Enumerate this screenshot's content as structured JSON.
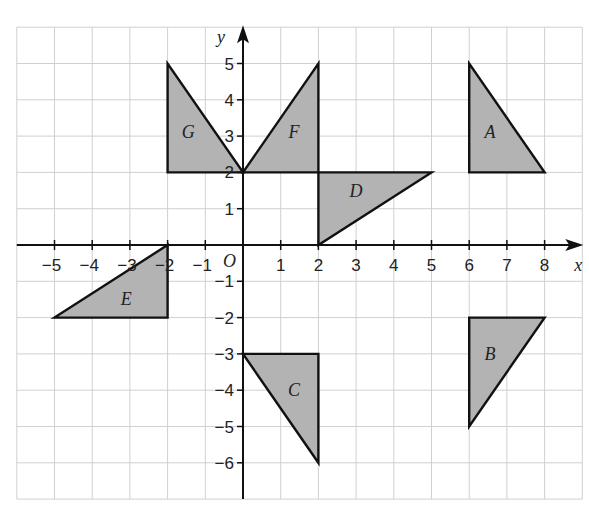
{
  "axes": {
    "x_label": "x",
    "y_label": "y",
    "origin_label": "O",
    "x_range": [
      -6,
      9
    ],
    "y_range": [
      -7,
      6
    ],
    "x_ticks": [
      -5,
      -4,
      -3,
      -2,
      -1,
      1,
      2,
      3,
      4,
      5,
      6,
      7,
      8
    ],
    "y_ticks": [
      5,
      4,
      3,
      2,
      1,
      -1,
      -2,
      -3,
      -4,
      -5,
      -6
    ]
  },
  "shapes": [
    {
      "label": "A",
      "points": [
        [
          6,
          5
        ],
        [
          6,
          2
        ],
        [
          8,
          2
        ]
      ],
      "label_pos": [
        6.55,
        3.1
      ]
    },
    {
      "label": "B",
      "points": [
        [
          6,
          -2
        ],
        [
          8,
          -2
        ],
        [
          6,
          -5
        ]
      ],
      "label_pos": [
        6.55,
        -3
      ]
    },
    {
      "label": "C",
      "points": [
        [
          0,
          -3
        ],
        [
          2,
          -3
        ],
        [
          2,
          -6
        ]
      ],
      "label_pos": [
        1.35,
        -4
      ]
    },
    {
      "label": "D",
      "points": [
        [
          2,
          2
        ],
        [
          5,
          2
        ],
        [
          2,
          0
        ]
      ],
      "label_pos": [
        3,
        1.5
      ]
    },
    {
      "label": "E",
      "points": [
        [
          -2,
          0
        ],
        [
          -2,
          -2
        ],
        [
          -5,
          -2
        ]
      ],
      "label_pos": [
        -3.1,
        -1.5
      ]
    },
    {
      "label": "F",
      "points": [
        [
          0,
          2
        ],
        [
          2,
          5
        ],
        [
          2,
          2
        ]
      ],
      "label_pos": [
        1.35,
        3.1
      ]
    },
    {
      "label": "G",
      "points": [
        [
          -2,
          5
        ],
        [
          -2,
          2
        ],
        [
          0,
          2
        ]
      ],
      "label_pos": [
        -1.45,
        3.1
      ]
    }
  ],
  "colors": {
    "fill": "#b3b3b3",
    "stroke": "#111111",
    "grid": "#d0d0d0"
  }
}
